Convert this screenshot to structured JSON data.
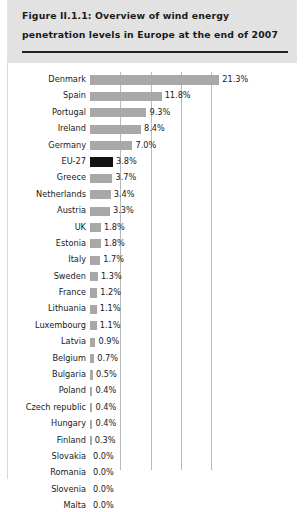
{
  "figure": {
    "title": "Figure II.1.1: Overview of wind energy penetration levels in Europe at the end of 2007"
  },
  "colors": {
    "header_background": "#e2e2e2",
    "bar": "#a8a8a8",
    "bar_highlight": "#121212",
    "gridline": "#b9b9b9",
    "text": "#1a1a1a",
    "rule": "#222222"
  },
  "chart_data": {
    "type": "bar",
    "orientation": "horizontal",
    "title": "Figure II.1.1: Overview of wind energy penetration levels in Europe at the end of 2007",
    "xlabel": "",
    "ylabel": "",
    "xlim": [
      0,
      22.5
    ],
    "grid": true,
    "gridlines": [
      5,
      10,
      15,
      20
    ],
    "legend": "none",
    "value_suffix": "%",
    "highlight_category": "EU-27",
    "categories": [
      "Denmark",
      "Spain",
      "Portugal",
      "Ireland",
      "Germany",
      "EU-27",
      "Greece",
      "Netherlands",
      "Austria",
      "UK",
      "Estonia",
      "Italy",
      "Sweden",
      "France",
      "Lithuania",
      "Luxembourg",
      "Latvia",
      "Belgium",
      "Bulgaria",
      "Poland",
      "Czech republic",
      "Hungary",
      "Finland",
      "Slovakia",
      "Romania",
      "Slovenia",
      "Malta"
    ],
    "values": [
      21.3,
      11.8,
      9.3,
      8.4,
      7.0,
      3.8,
      3.7,
      3.4,
      3.3,
      1.8,
      1.8,
      1.7,
      1.3,
      1.2,
      1.1,
      1.1,
      0.9,
      0.7,
      0.5,
      0.4,
      0.4,
      0.4,
      0.3,
      0.0,
      0.0,
      0.0,
      0.0
    ],
    "value_labels": [
      "21.3%",
      "11.8%",
      "9.3%",
      "8.4%",
      "7.0%",
      "3.8%",
      "3.7%",
      "3.4%",
      "3.3%",
      "1.8%",
      "1.8%",
      "1.7%",
      "1.3%",
      "1.2%",
      "1.1%",
      "1.1%",
      "0.9%",
      "0.7%",
      "0.5%",
      "0.4%",
      "0.4%",
      "0.4%",
      "0.3%",
      "0.0%",
      "0.0%",
      "0.0%",
      "0.0%"
    ]
  }
}
